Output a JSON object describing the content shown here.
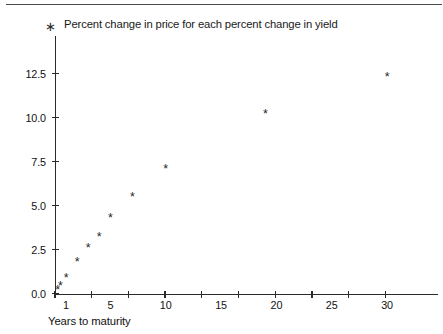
{
  "legend": {
    "marker": "asterisk-marker",
    "marker_glyph": "∗",
    "label": "Percent change in price for each percent change in yield"
  },
  "axis_title_x": "Years to maturity",
  "colors": {
    "axis": "#2b2b2b",
    "text": "#111111",
    "marker": "#262626",
    "rule": "#4a4a4a"
  },
  "chart_data": {
    "type": "scatter",
    "title": "",
    "subtitle": "",
    "xlabel": "Years to maturity",
    "ylabel": "",
    "legend_position": "top-left",
    "grid": false,
    "xlim": [
      0,
      33
    ],
    "ylim": [
      0,
      13.4
    ],
    "x_ticks": [
      1,
      5,
      10,
      15,
      20,
      25,
      30
    ],
    "x_tick_labels": [
      "1",
      "5",
      "10",
      "15",
      "20",
      "25",
      "30"
    ],
    "y_ticks": [
      0.0,
      2.5,
      5.0,
      7.5,
      10.0,
      12.5
    ],
    "y_tick_labels": [
      "0.0",
      "2.5",
      "5.0",
      "7.5",
      "10.0",
      "12.5"
    ],
    "series": [
      {
        "name": "Percent change in price for each percent change in yield",
        "marker": "*",
        "x": [
          0.25,
          0.5,
          1,
          2,
          3,
          4,
          5,
          7,
          10,
          19,
          30
        ],
        "y": [
          0.2,
          0.45,
          0.9,
          1.8,
          2.6,
          3.2,
          4.3,
          5.5,
          7.1,
          10.2,
          12.3
        ]
      }
    ]
  }
}
